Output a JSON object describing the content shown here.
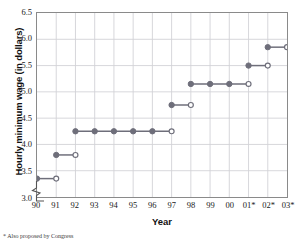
{
  "chart_data": {
    "type": "line",
    "subtype": "step",
    "title": "",
    "xlabel": "Year",
    "ylabel": "Hourly minimum wage (in dollars)",
    "xtick_labels": [
      "90",
      "91",
      "92",
      "93",
      "94",
      "95",
      "96",
      "97",
      "98",
      "99",
      "00",
      "01*",
      "02*",
      "03*"
    ],
    "x": [
      1990,
      1991,
      1992,
      1993,
      1994,
      1995,
      1996,
      1997,
      1998,
      1999,
      2000,
      2001,
      2002,
      2003
    ],
    "values": [
      3.35,
      3.8,
      4.25,
      4.25,
      4.25,
      4.25,
      4.25,
      4.75,
      5.15,
      5.15,
      5.15,
      5.5,
      5.85,
      5.85
    ],
    "ytick_labels": [
      "3.0",
      "3.5",
      "4.0",
      "4.5",
      "5.0",
      "5.5",
      "6.0",
      "6.5"
    ],
    "ytick_values": [
      3.0,
      3.5,
      4.0,
      4.5,
      5.0,
      5.5,
      6.0,
      6.5
    ],
    "ylim": [
      3.0,
      6.5
    ],
    "xlim_index": [
      0,
      13
    ],
    "grid": true,
    "legend": "none",
    "axis_break": true,
    "footnote": "* Also proposed by Congress",
    "series_color": "#6e6e7a",
    "grid_color": "#d2d2d6",
    "frame_color": "#8a8a8a",
    "steps": [
      {
        "start_label": "90",
        "end_label": "91",
        "value": 3.35,
        "start_index": 0,
        "end_index": 1
      },
      {
        "start_label": "91",
        "end_label": "92",
        "value": 3.8,
        "start_index": 1,
        "end_index": 2
      },
      {
        "start_label": "92",
        "end_label": "97",
        "value": 4.25,
        "start_index": 2,
        "end_index": 7
      },
      {
        "start_label": "97",
        "end_label": "98",
        "value": 4.75,
        "start_index": 7,
        "end_index": 8
      },
      {
        "start_label": "98",
        "end_label": "01*",
        "value": 5.15,
        "start_index": 8,
        "end_index": 11
      },
      {
        "start_label": "01*",
        "end_label": "02*",
        "value": 5.5,
        "start_index": 11,
        "end_index": 12
      },
      {
        "start_label": "02*",
        "end_label": "03*",
        "value": 5.85,
        "start_index": 12,
        "end_index": 13
      }
    ],
    "interior_solid_points": [
      {
        "index": 3,
        "value": 4.25
      },
      {
        "index": 4,
        "value": 4.25
      },
      {
        "index": 5,
        "value": 4.25
      },
      {
        "index": 6,
        "value": 4.25
      },
      {
        "index": 9,
        "value": 5.15
      },
      {
        "index": 10,
        "value": 5.15
      }
    ]
  }
}
